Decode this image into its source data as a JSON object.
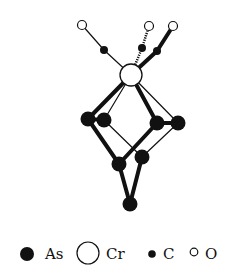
{
  "diagram": {
    "colors": {
      "ink": "#111111",
      "background": "#ffffff"
    },
    "atoms": [
      {
        "id": "O1",
        "element": "O",
        "x": 82,
        "y": 25
      },
      {
        "id": "O2",
        "element": "O",
        "x": 149,
        "y": 26
      },
      {
        "id": "O3",
        "element": "O",
        "x": 173,
        "y": 26
      },
      {
        "id": "C1",
        "element": "C",
        "x": 104,
        "y": 50
      },
      {
        "id": "C2",
        "element": "C",
        "x": 142,
        "y": 48
      },
      {
        "id": "C3",
        "element": "C",
        "x": 157,
        "y": 51
      },
      {
        "id": "Cr",
        "element": "Cr",
        "x": 131,
        "y": 75
      },
      {
        "id": "As1",
        "element": "As",
        "x": 88,
        "y": 119
      },
      {
        "id": "As2",
        "element": "As",
        "x": 104,
        "y": 120
      },
      {
        "id": "As3",
        "element": "As",
        "x": 157,
        "y": 123
      },
      {
        "id": "As4",
        "element": "As",
        "x": 178,
        "y": 123
      },
      {
        "id": "As5",
        "element": "As",
        "x": 119,
        "y": 164
      },
      {
        "id": "As6",
        "element": "As",
        "x": 142,
        "y": 157
      },
      {
        "id": "As7",
        "element": "As",
        "x": 130,
        "y": 204
      }
    ],
    "bonds": [
      {
        "from": "O1",
        "to": "C1",
        "style": "thin"
      },
      {
        "from": "C1",
        "to": "Cr",
        "style": "thin"
      },
      {
        "from": "O2",
        "to": "C2",
        "style": "dashed"
      },
      {
        "from": "C2",
        "to": "Cr",
        "style": "dashed"
      },
      {
        "from": "O3",
        "to": "C3",
        "style": "thick"
      },
      {
        "from": "C3",
        "to": "Cr",
        "style": "thick"
      },
      {
        "from": "Cr",
        "to": "As1",
        "style": "thick"
      },
      {
        "from": "Cr",
        "to": "As2",
        "style": "thin"
      },
      {
        "from": "Cr",
        "to": "As3",
        "style": "thick"
      },
      {
        "from": "Cr",
        "to": "As4",
        "style": "thin"
      },
      {
        "from": "As1",
        "to": "As2",
        "style": "thick"
      },
      {
        "from": "As3",
        "to": "As4",
        "style": "thick"
      },
      {
        "from": "As1",
        "to": "As5",
        "style": "thick"
      },
      {
        "from": "As2",
        "to": "As6",
        "style": "thin"
      },
      {
        "from": "As3",
        "to": "As5",
        "style": "thick"
      },
      {
        "from": "As4",
        "to": "As6",
        "style": "thin"
      },
      {
        "from": "As5",
        "to": "As7",
        "style": "thick"
      },
      {
        "from": "As6",
        "to": "As7",
        "style": "thick"
      }
    ]
  },
  "legend": {
    "items": [
      {
        "symbol": "As",
        "label": "As"
      },
      {
        "symbol": "Cr",
        "label": "Cr"
      },
      {
        "symbol": "C",
        "label": "C"
      },
      {
        "symbol": "O",
        "label": "O"
      }
    ]
  }
}
